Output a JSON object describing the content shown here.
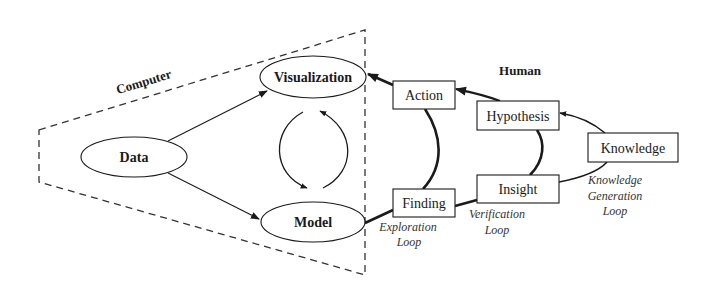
{
  "diagram": {
    "type": "flow",
    "groups": {
      "computer": {
        "label": "Computer"
      },
      "human": {
        "label": "Human"
      }
    },
    "nodes": {
      "data": {
        "label": "Data",
        "shape": "ellipse"
      },
      "visualization": {
        "label": "Visualization",
        "shape": "ellipse"
      },
      "model": {
        "label": "Model",
        "shape": "ellipse"
      },
      "action": {
        "label": "Action",
        "shape": "box"
      },
      "finding": {
        "label": "Finding",
        "shape": "box"
      },
      "hypothesis": {
        "label": "Hypothesis",
        "shape": "box"
      },
      "insight": {
        "label": "Insight",
        "shape": "box"
      },
      "knowledge": {
        "label": "Knowledge",
        "shape": "box"
      }
    },
    "loops": {
      "exploration": {
        "line1": "Exploration",
        "line2": "Loop"
      },
      "verification": {
        "line1": "Verification",
        "line2": "Loop"
      },
      "knowledge_generation": {
        "line1": "Knowledge",
        "line2": "Generation",
        "line3": "Loop"
      }
    },
    "edges": [
      {
        "from": "Data",
        "to": "Visualization"
      },
      {
        "from": "Data",
        "to": "Model"
      },
      {
        "from": "Visualization",
        "to": "Model",
        "style": "cycle"
      },
      {
        "from": "Model",
        "to": "Visualization",
        "style": "cycle"
      },
      {
        "from": "Model",
        "to": "Finding",
        "style": "thick"
      },
      {
        "from": "Finding",
        "to": "Action",
        "style": "thick"
      },
      {
        "from": "Action",
        "to": "Visualization",
        "style": "thick"
      },
      {
        "from": "Finding",
        "to": "Insight",
        "style": "thick"
      },
      {
        "from": "Insight",
        "to": "Hypothesis",
        "style": "thick"
      },
      {
        "from": "Hypothesis",
        "to": "Action",
        "style": "thick"
      },
      {
        "from": "Insight",
        "to": "Knowledge"
      },
      {
        "from": "Knowledge",
        "to": "Hypothesis"
      }
    ],
    "colors": {
      "stroke": "#1a1a1a",
      "background": "#ffffff"
    }
  }
}
